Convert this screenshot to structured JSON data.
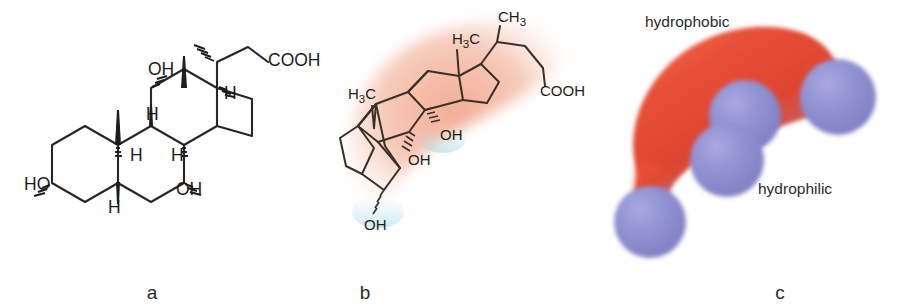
{
  "figure": {
    "panels": [
      {
        "id": "a",
        "label": "a",
        "caption": "skeletal structural formula"
      },
      {
        "id": "b",
        "label": "b",
        "caption": "three-dimensional conformation"
      },
      {
        "id": "c",
        "label": "c",
        "caption": "space-filling amphipathic model"
      }
    ]
  },
  "panel_a": {
    "atom_labels": [
      {
        "id": "cooh",
        "text": "COOH",
        "x": 268,
        "y": 66
      },
      {
        "id": "oh12",
        "text": "OH",
        "x": 148,
        "y": 75
      },
      {
        "id": "ho3",
        "text": "HO",
        "x": 24,
        "y": 190
      },
      {
        "id": "oh7",
        "text": "OH",
        "x": 176,
        "y": 195
      },
      {
        "id": "h17",
        "text": "H",
        "x": 224,
        "y": 99
      },
      {
        "id": "h8",
        "text": "H",
        "x": 146,
        "y": 120
      },
      {
        "id": "h9",
        "text": "H",
        "x": 130,
        "y": 161
      },
      {
        "id": "h14",
        "text": "H",
        "x": 171,
        "y": 161
      },
      {
        "id": "h5",
        "text": "H",
        "x": 108,
        "y": 213
      }
    ],
    "stereo_notes": "3-alpha-OH, 7-alpha-OH, 12-alpha-OH, 5-beta-H; C18 and C19 methyl wedges"
  },
  "panel_b": {
    "atom_labels": [
      {
        "id": "ch3-c18",
        "text": "H",
        "sub": "3",
        "tail": "C",
        "x": 465,
        "y": 42
      },
      {
        "id": "ch3-c21",
        "text": "CH",
        "sub": "3",
        "tail": "",
        "x": 508,
        "y": 22
      },
      {
        "id": "cooh",
        "text": "COOH",
        "sub": "",
        "tail": "",
        "x": 548,
        "y": 92
      },
      {
        "id": "ch3-c19",
        "text": "H",
        "sub": "3",
        "tail": "C",
        "x": 358,
        "y": 97
      },
      {
        "id": "oh12",
        "text": "OH",
        "sub": "",
        "tail": "",
        "x": 438,
        "y": 142
      },
      {
        "id": "oh7",
        "text": "OH",
        "sub": "",
        "tail": "",
        "x": 428,
        "y": 161
      },
      {
        "id": "oh3",
        "text": "OH",
        "sub": "",
        "tail": "",
        "x": 372,
        "y": 232
      }
    ],
    "halo_color": "#f2b5a0",
    "halo_note": "salmon shading marks the hydrophobic convex face"
  },
  "panel_c": {
    "labels": [
      {
        "id": "hydrophobic",
        "text": "hydrophobic",
        "x": 645,
        "y": 14
      },
      {
        "id": "hydrophilic",
        "text": "hydrophilic",
        "x": 758,
        "y": 180
      }
    ],
    "colors": {
      "hydrophobic_surface": "#e8503a",
      "hydrophobic_deep": "#d9402c",
      "hydrophilic_sphere": "#8d8ecd",
      "transition_cyan": "#63c4e0"
    },
    "spheres": [
      {
        "id": "oh-sphere-top-right",
        "cx": 838,
        "cy": 97,
        "r": 38
      },
      {
        "id": "oh-sphere-mid-upper",
        "cx": 745,
        "cy": 116,
        "r": 36
      },
      {
        "id": "oh-sphere-mid-lower",
        "cx": 727,
        "cy": 160,
        "r": 37
      },
      {
        "id": "oh-sphere-bottom-left",
        "cx": 650,
        "cy": 222,
        "r": 36
      }
    ]
  }
}
